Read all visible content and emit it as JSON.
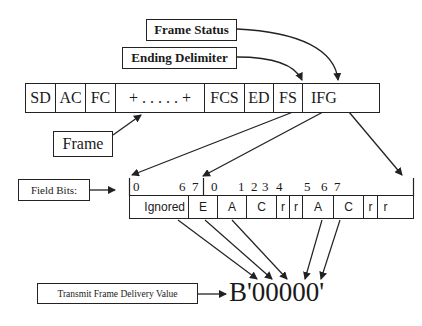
{
  "labels": {
    "frame_status": "Frame Status",
    "ending_delimiter": "Ending Delimiter",
    "frame": "Frame",
    "field_bits": "Field Bits:",
    "transmit_frame_delivery_value": "Transmit Frame Delivery Value",
    "delivery_value": "B'00000'"
  },
  "frame_fields": [
    {
      "label": "SD",
      "width": 30
    },
    {
      "label": "AC",
      "width": 30
    },
    {
      "label": "FC",
      "width": 30
    },
    {
      "label": "+ . . . . . +",
      "width": 89
    },
    {
      "label": "FCS",
      "width": 40
    },
    {
      "label": "ED",
      "width": 29
    },
    {
      "label": "FS",
      "width": 29
    },
    {
      "label": "IFG",
      "width": 78
    }
  ],
  "bit_fields": [
    {
      "label": "Ignored",
      "width": 59
    },
    {
      "label": "E",
      "width": 29
    },
    {
      "label": "A",
      "width": 29
    },
    {
      "label": "C",
      "width": 30
    },
    {
      "label": "r",
      "width": 13
    },
    {
      "label": "r",
      "width": 13
    },
    {
      "label": "A",
      "width": 31
    },
    {
      "label": "C",
      "width": 30
    },
    {
      "label": "r",
      "width": 14
    },
    {
      "label": "r",
      "width": 15
    }
  ],
  "bit_numbers": [
    {
      "label": "0",
      "x": 133
    },
    {
      "label": "6",
      "x": 179
    },
    {
      "label": "7",
      "x": 192
    },
    {
      "label": "0",
      "x": 211
    },
    {
      "label": "1",
      "x": 238
    },
    {
      "label": "2",
      "x": 251
    },
    {
      "label": "3",
      "x": 262
    },
    {
      "label": "4",
      "x": 276
    },
    {
      "label": "5",
      "x": 304
    },
    {
      "label": "6",
      "x": 321
    },
    {
      "label": "7",
      "x": 334
    }
  ]
}
